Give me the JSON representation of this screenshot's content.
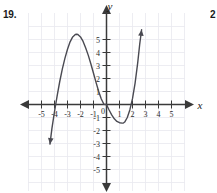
{
  "exercise": {
    "number_label": "19.",
    "next_number_label": "2"
  },
  "axes": {
    "x_name": "x",
    "y_name": "y",
    "x_tick_labels": [
      "-5",
      "-4",
      "-3",
      "-2",
      "-1",
      "0",
      "1",
      "2",
      "3",
      "4",
      "5"
    ],
    "y_tick_labels": [
      "5",
      "4",
      "3",
      "2",
      "1",
      "-1",
      "-2",
      "-3",
      "-4",
      "-5"
    ],
    "origin_label": "0",
    "arrow_directions": [
      "left",
      "right",
      "up",
      "down"
    ]
  },
  "colors": {
    "curve": "#4a4a52",
    "axis": "#3a3a3a",
    "grid": "#e9e9ef",
    "text": "#1a1a1a",
    "background": "#ffffff"
  },
  "chart_data": {
    "type": "line",
    "title": "",
    "xlabel": "x",
    "ylabel": "y",
    "xlim": [
      -5.8,
      5.8
    ],
    "ylim": [
      -5.8,
      5.8
    ],
    "grid": true,
    "legend": null,
    "x_ticks": [
      -5,
      -4,
      -3,
      -2,
      -1,
      0,
      1,
      2,
      3,
      4,
      5
    ],
    "y_ticks": [
      -5,
      -4,
      -3,
      -2,
      -1,
      1,
      2,
      3,
      4,
      5
    ],
    "annotations": [
      "x-intercepts at x = -4, x = 0, x = 2",
      "local maximum near (-2.3, 5.4)",
      "local minimum near (1.3, -1.4)",
      "arrowheads on both ends of curve"
    ],
    "series": [
      {
        "name": "cubic",
        "x": [
          -4.35,
          -4.2,
          -4.0,
          -3.8,
          -3.6,
          -3.4,
          -3.2,
          -3.0,
          -2.8,
          -2.6,
          -2.4,
          -2.3,
          -2.2,
          -2.0,
          -1.8,
          -1.6,
          -1.4,
          -1.2,
          -1.0,
          -0.8,
          -0.6,
          -0.4,
          -0.2,
          0.0,
          0.2,
          0.4,
          0.6,
          0.8,
          1.0,
          1.2,
          1.3,
          1.4,
          1.6,
          1.8,
          2.0,
          2.2,
          2.4,
          2.55,
          2.7
        ],
        "y": [
          -3.05,
          -1.85,
          -0.55,
          0.65,
          1.75,
          2.72,
          3.55,
          4.25,
          4.82,
          5.2,
          5.38,
          5.4,
          5.38,
          5.2,
          4.85,
          4.35,
          3.78,
          3.12,
          2.4,
          1.68,
          1.0,
          0.42,
          0.02,
          0.0,
          -0.42,
          -0.8,
          -1.1,
          -1.3,
          -1.4,
          -1.43,
          -1.42,
          -1.35,
          -1.0,
          -0.4,
          0.45,
          1.65,
          3.2,
          4.6,
          5.75
        ]
      }
    ]
  }
}
